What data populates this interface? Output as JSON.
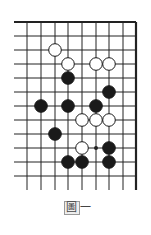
{
  "diagram": {
    "title": "圖一",
    "title_char": "圖",
    "title_suffix": "一",
    "board": {
      "columns_x": [
        27,
        41,
        55,
        68,
        82,
        96,
        109,
        123,
        136
      ],
      "rows_y": [
        22,
        36,
        50,
        64,
        78,
        92,
        106,
        120,
        134,
        148,
        162,
        176
      ],
      "left_edge_x": 14,
      "bottom_extent_y": 190,
      "top_edge": "thick",
      "right_edge": "thick",
      "line_color": "#222222",
      "stones": [
        {
          "color": "white",
          "col": 2,
          "row": 2
        },
        {
          "color": "white",
          "col": 3,
          "row": 3
        },
        {
          "color": "white",
          "col": 5,
          "row": 3
        },
        {
          "color": "white",
          "col": 6,
          "row": 3
        },
        {
          "color": "black",
          "col": 3,
          "row": 4
        },
        {
          "color": "black",
          "col": 6,
          "row": 5
        },
        {
          "color": "black",
          "col": 1,
          "row": 6
        },
        {
          "color": "black",
          "col": 3,
          "row": 6
        },
        {
          "color": "black",
          "col": 5,
          "row": 6
        },
        {
          "color": "white",
          "col": 4,
          "row": 7
        },
        {
          "color": "white",
          "col": 5,
          "row": 7
        },
        {
          "color": "white",
          "col": 6,
          "row": 7
        },
        {
          "color": "black",
          "col": 2,
          "row": 8
        },
        {
          "color": "white",
          "col": 4,
          "row": 9
        },
        {
          "color": "black",
          "col": 6,
          "row": 9
        },
        {
          "color": "black",
          "col": 3,
          "row": 10
        },
        {
          "color": "black",
          "col": 4,
          "row": 10
        },
        {
          "color": "black",
          "col": 6,
          "row": 10
        }
      ],
      "markers": [
        {
          "type": "dot",
          "col": 5,
          "row": 9
        }
      ]
    }
  }
}
